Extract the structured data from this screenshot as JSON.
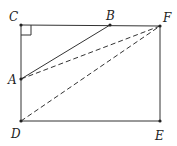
{
  "diagram": {
    "type": "geometry",
    "points": {
      "C": {
        "label": "C",
        "x": 21,
        "y": 25
      },
      "B": {
        "label": "B",
        "x": 110,
        "y": 25
      },
      "F": {
        "label": "F",
        "x": 160,
        "y": 26
      },
      "A": {
        "label": "A",
        "x": 21,
        "y": 79
      },
      "D": {
        "label": "D",
        "x": 21,
        "y": 121
      },
      "E": {
        "label": "E",
        "x": 160,
        "y": 121
      }
    },
    "solid_segments": [
      "CF",
      "FE",
      "ED",
      "DC",
      "AB"
    ],
    "dashed_segments": [
      "AF",
      "DF"
    ],
    "right_angle_at": "C"
  }
}
